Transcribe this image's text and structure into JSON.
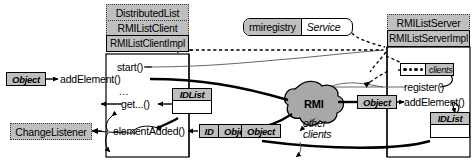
{
  "diagram": {
    "colors": {
      "fill_gray": "#bfbfbf",
      "fill_white": "#ffffff",
      "stroke": "#000000",
      "cloud_fill": "#a8a8a8"
    },
    "client_stack": {
      "interfaces": [
        {
          "label": "DistributedList"
        },
        {
          "label": "RMIListClient"
        }
      ],
      "implementation": {
        "label": "RMIListClientImpl"
      },
      "methods": [
        {
          "label": "start()"
        },
        {
          "label": "addElement()"
        },
        {
          "label": "..."
        },
        {
          "label": "get...()"
        },
        {
          "label": "elementAdded()"
        }
      ]
    },
    "server_stack": {
      "interfaces": [
        {
          "label": "RMIListServer"
        }
      ],
      "implementation": {
        "label": "RMIListServerImpl"
      },
      "methods": [
        {
          "label": "register()"
        },
        {
          "label": "addElement()"
        }
      ]
    },
    "registry": {
      "name": "rmiregistry",
      "service": "Service"
    },
    "clients_collection": {
      "label": "clients",
      "slot_count": 4
    },
    "cloud": {
      "label": "RMI"
    },
    "listener": {
      "label": "ChangeListener"
    },
    "tokens": [
      {
        "name": "object-param-client",
        "label": "Object"
      },
      {
        "name": "idlist-client",
        "label": "IDList"
      },
      {
        "name": "id-param",
        "label": "ID"
      },
      {
        "name": "object-param-callback",
        "label": "Object"
      },
      {
        "name": "object-param-cloud",
        "label": "Object"
      },
      {
        "name": "object-param-server",
        "label": "Object"
      },
      {
        "name": "idlist-server",
        "label": "IDList"
      }
    ],
    "annotations": [
      {
        "name": "other-clients-note",
        "line1": "other",
        "line2": "clients"
      }
    ]
  }
}
